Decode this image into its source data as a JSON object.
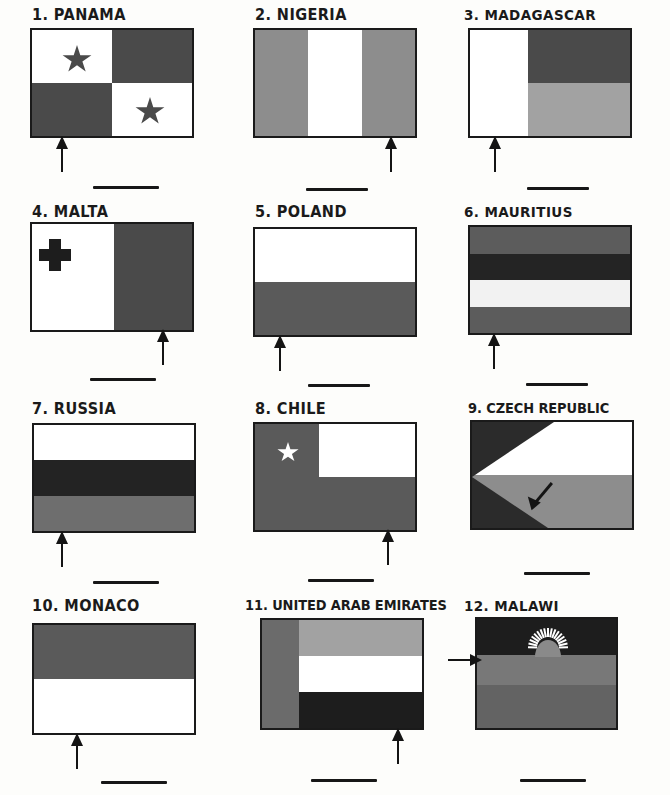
{
  "worksheet": {
    "kind": "flag-identification-worksheet",
    "columns": 3,
    "rows": 4,
    "palette": {
      "ink": "#1a1a1a",
      "paper": "#fdfdfb",
      "dark": "#3f3f3f",
      "darker": "#232323",
      "black": "#141414",
      "mid_gray": "#5c5c5c",
      "gray": "#6e6e6e",
      "light_gray": "#a8a8a8",
      "pale_gray": "#bdbdbd",
      "white": "#ffffff"
    }
  },
  "items": [
    {
      "number": "1.",
      "label": "1. PANAMA",
      "name": "PANAMA",
      "arrow": {
        "type": "up",
        "points_at": "bottom-left-quadrant"
      },
      "answer_blank": "",
      "design": "quartered with two stars"
    },
    {
      "number": "2.",
      "label": "2. NIGERIA",
      "name": "NIGERIA",
      "arrow": {
        "type": "up",
        "points_at": "right-vertical-band"
      },
      "answer_blank": "",
      "design": "three vertical bands"
    },
    {
      "number": "3.",
      "label": "3. MADAGASCAR",
      "name": "MADAGASCAR",
      "arrow": {
        "type": "up",
        "points_at": "left-vertical-band"
      },
      "answer_blank": "",
      "design": "vertical band at hoist plus two horizontal bands"
    },
    {
      "number": "4.",
      "label": "4. MALTA",
      "name": "MALTA",
      "arrow": {
        "type": "up",
        "points_at": "right-vertical-half"
      },
      "answer_blank": "",
      "design": "two vertical halves with cross in canton"
    },
    {
      "number": "5.",
      "label": "5. POLAND",
      "name": "POLAND",
      "arrow": {
        "type": "up",
        "points_at": "lower-horizontal-band"
      },
      "answer_blank": "",
      "design": "two horizontal bands"
    },
    {
      "number": "6.",
      "label": "6. MAURITIUS",
      "name": "MAURITIUS",
      "arrow": {
        "type": "up",
        "points_at": "bottom-horizontal-band"
      },
      "answer_blank": "",
      "design": "four horizontal bands"
    },
    {
      "number": "7.",
      "label": "7. RUSSIA",
      "name": "RUSSIA",
      "arrow": {
        "type": "up",
        "points_at": "bottom-horizontal-band"
      },
      "answer_blank": "",
      "design": "three horizontal bands"
    },
    {
      "number": "8.",
      "label": "8. CHILE",
      "name": "CHILE",
      "arrow": {
        "type": "up",
        "points_at": "lower-horizontal-band"
      },
      "answer_blank": "",
      "design": "canton with star plus two horizontal bands"
    },
    {
      "number": "9.",
      "label": "9. CZECH REPUBLIC",
      "name": "CZECH REPUBLIC",
      "arrow": {
        "type": "diagonal-up-left",
        "points_at": "hoist-triangle"
      },
      "answer_blank": "",
      "design": "two horizontal bands with triangle at hoist"
    },
    {
      "number": "10.",
      "label": "10. MONACO",
      "name": "MONACO",
      "arrow": {
        "type": "up",
        "points_at": "lower-horizontal-band"
      },
      "answer_blank": "",
      "design": "two horizontal bands"
    },
    {
      "number": "11.",
      "label": "11. UNITED ARAB EMIRATES",
      "name": "UNITED ARAB EMIRATES",
      "arrow": {
        "type": "up",
        "points_at": "bottom-horizontal-band"
      },
      "answer_blank": "",
      "design": "vertical band at hoist plus three horizontal bands"
    },
    {
      "number": "12.",
      "label": "12. MALAWI",
      "name": "MALAWI",
      "arrow": {
        "type": "right",
        "points_at": "middle-horizontal-band"
      },
      "answer_blank": "",
      "design": "three horizontal bands with rising sun"
    }
  ]
}
